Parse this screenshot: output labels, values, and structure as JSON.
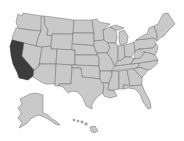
{
  "map": {
    "title": "United States map",
    "highlighted_state": "California",
    "colors": {
      "background": "#ffffff",
      "state_fill": "#c9c9c9",
      "state_stroke": "#6a6a6a",
      "highlight_fill": "#3c3c3c"
    },
    "states": [
      {
        "name": "Washington",
        "highlighted": false
      },
      {
        "name": "Oregon",
        "highlighted": false
      },
      {
        "name": "California",
        "highlighted": true
      },
      {
        "name": "Nevada",
        "highlighted": false
      },
      {
        "name": "Idaho",
        "highlighted": false
      },
      {
        "name": "Montana",
        "highlighted": false
      },
      {
        "name": "Wyoming",
        "highlighted": false
      },
      {
        "name": "Utah",
        "highlighted": false
      },
      {
        "name": "Arizona",
        "highlighted": false
      },
      {
        "name": "Colorado",
        "highlighted": false
      },
      {
        "name": "New Mexico",
        "highlighted": false
      },
      {
        "name": "North Dakota",
        "highlighted": false
      },
      {
        "name": "South Dakota",
        "highlighted": false
      },
      {
        "name": "Nebraska",
        "highlighted": false
      },
      {
        "name": "Kansas",
        "highlighted": false
      },
      {
        "name": "Oklahoma",
        "highlighted": false
      },
      {
        "name": "Texas",
        "highlighted": false
      },
      {
        "name": "Minnesota",
        "highlighted": false
      },
      {
        "name": "Iowa",
        "highlighted": false
      },
      {
        "name": "Missouri",
        "highlighted": false
      },
      {
        "name": "Arkansas",
        "highlighted": false
      },
      {
        "name": "Louisiana",
        "highlighted": false
      },
      {
        "name": "Wisconsin",
        "highlighted": false
      },
      {
        "name": "Illinois",
        "highlighted": false
      },
      {
        "name": "Michigan",
        "highlighted": false
      },
      {
        "name": "Indiana",
        "highlighted": false
      },
      {
        "name": "Ohio",
        "highlighted": false
      },
      {
        "name": "Kentucky",
        "highlighted": false
      },
      {
        "name": "Tennessee",
        "highlighted": false
      },
      {
        "name": "Mississippi",
        "highlighted": false
      },
      {
        "name": "Alabama",
        "highlighted": false
      },
      {
        "name": "Georgia",
        "highlighted": false
      },
      {
        "name": "Florida",
        "highlighted": false
      },
      {
        "name": "South Carolina",
        "highlighted": false
      },
      {
        "name": "North Carolina",
        "highlighted": false
      },
      {
        "name": "Virginia",
        "highlighted": false
      },
      {
        "name": "West Virginia",
        "highlighted": false
      },
      {
        "name": "Pennsylvania",
        "highlighted": false
      },
      {
        "name": "New York",
        "highlighted": false
      },
      {
        "name": "New England",
        "highlighted": false
      },
      {
        "name": "Mid-Atlantic",
        "highlighted": false
      },
      {
        "name": "Alaska",
        "highlighted": false
      },
      {
        "name": "Hawaii",
        "highlighted": false
      }
    ]
  }
}
